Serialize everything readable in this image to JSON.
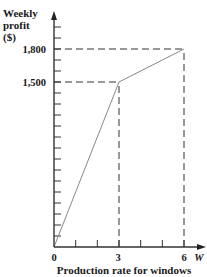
{
  "chart_data": {
    "type": "line",
    "title": "",
    "xlabel": "Production rate for windows",
    "xvar": "W",
    "ylabel_lines": [
      "Weekly",
      "profit",
      "($)"
    ],
    "x": [
      0,
      3,
      6
    ],
    "series": [
      {
        "name": "Weekly profit",
        "values": [
          0,
          1500,
          1800
        ]
      }
    ],
    "x_tick_labels": [
      "0",
      "3",
      "6"
    ],
    "y_tick_labels": [
      "1,500",
      "1,800"
    ],
    "xlim": [
      0,
      7
    ],
    "ylim": [
      0,
      2100
    ],
    "x_minor_tick_step": 1,
    "y_minor_tick_step": 100,
    "reference_lines": [
      {
        "type": "dashed",
        "from": [
          0,
          1800
        ],
        "to": [
          6,
          1800
        ]
      },
      {
        "type": "dashed",
        "from": [
          0,
          1500
        ],
        "to": [
          3,
          1500
        ]
      },
      {
        "type": "dashed",
        "from": [
          3,
          0
        ],
        "to": [
          3,
          1500
        ]
      },
      {
        "type": "dashed",
        "from": [
          6,
          0
        ],
        "to": [
          6,
          1800
        ]
      }
    ],
    "grid": false,
    "legend": "none",
    "colors": {
      "axis": "#333333",
      "line": "#888888",
      "text": "#1a1a1a"
    }
  }
}
